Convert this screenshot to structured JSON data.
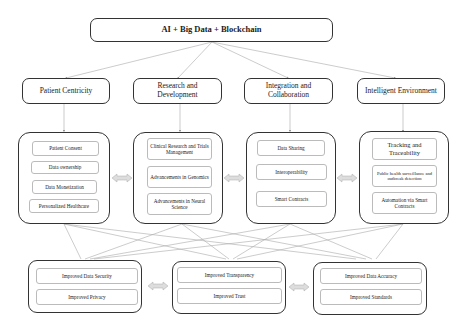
{
  "title": "AI + Big Data + Blockchain",
  "pillars": [
    {
      "label": "Patient Centricity",
      "items": [
        "Patient Consent",
        "Data ownership",
        "Data Monetization",
        "Personalized Healthcare"
      ]
    },
    {
      "label": "Research and Development",
      "items": [
        "Clinical Research and Trials Management",
        "Advancements in Genomics",
        "Advancements in Neural Science"
      ]
    },
    {
      "label": "Integration and Collaboration",
      "items": [
        "Data Sharing",
        "Interoperability",
        "Smart Contracts"
      ]
    },
    {
      "label": "Intelligent Environment",
      "items": [
        "Tracking and Traceability",
        "Public health surveillance and outbreak detection",
        "Automation via Smart Contracts"
      ]
    }
  ],
  "outcomes": [
    {
      "items": [
        "Improved Data Security",
        "Improved Privacy"
      ]
    },
    {
      "items": [
        "Improved Transparency",
        "Improved Trust"
      ]
    },
    {
      "items": [
        "Improved Data Accuracy",
        "Improved Standards"
      ]
    }
  ],
  "colors": {
    "border": "#333333",
    "connector": "#aaaaaa",
    "item_border": "#bbbbbb",
    "arrow_fill": "#dddddd"
  }
}
